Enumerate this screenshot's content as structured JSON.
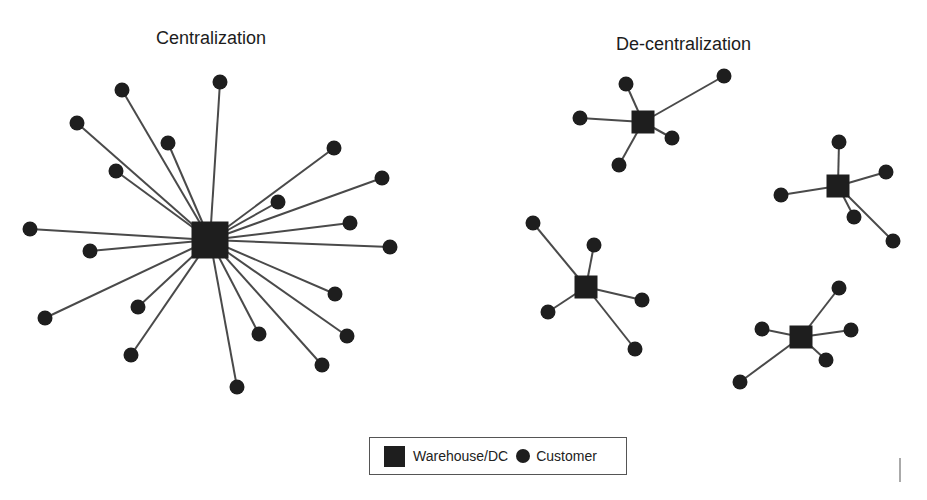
{
  "titles": {
    "centralization": "Centralization",
    "decentralization": "De-centralization"
  },
  "legend": {
    "warehouse_label": "Warehouse/DC",
    "customer_label": "Customer"
  },
  "colors": {
    "node": "#1e1e1e",
    "edge": "#4a4a4a",
    "background": "#ffffff"
  },
  "networks": {
    "centralization": {
      "hubs": [
        {
          "x": 210,
          "y": 240,
          "size": 37,
          "customers": [
            [
              122,
              90
            ],
            [
              220,
              82
            ],
            [
              77,
              123
            ],
            [
              168,
              143
            ],
            [
              116,
              171
            ],
            [
              334,
              148
            ],
            [
              382,
              178
            ],
            [
              278,
              202
            ],
            [
              350,
              223
            ],
            [
              30,
              229
            ],
            [
              390,
              247
            ],
            [
              90,
              251
            ],
            [
              45,
              318
            ],
            [
              138,
              307
            ],
            [
              335,
              294
            ],
            [
              131,
              355
            ],
            [
              259,
              334
            ],
            [
              347,
              336
            ],
            [
              322,
              365
            ],
            [
              237,
              387
            ]
          ]
        }
      ]
    },
    "decentralization": {
      "hubs": [
        {
          "x": 643,
          "y": 122,
          "size": 23,
          "customers": [
            [
              626,
              84
            ],
            [
              580,
              118
            ],
            [
              724,
              76
            ],
            [
              672,
              138
            ],
            [
              619,
              165
            ]
          ]
        },
        {
          "x": 838,
          "y": 186,
          "size": 23,
          "customers": [
            [
              839,
              142
            ],
            [
              886,
              172
            ],
            [
              781,
              195
            ],
            [
              854,
              217
            ],
            [
              893,
              241
            ]
          ]
        },
        {
          "x": 586,
          "y": 287,
          "size": 23,
          "customers": [
            [
              533,
              223
            ],
            [
              594,
              245
            ],
            [
              548,
              312
            ],
            [
              642,
              300
            ],
            [
              635,
              349
            ]
          ]
        },
        {
          "x": 801,
          "y": 337,
          "size": 23,
          "customers": [
            [
              839,
              288
            ],
            [
              762,
              329
            ],
            [
              851,
              330
            ],
            [
              826,
              360
            ],
            [
              740,
              382
            ]
          ]
        }
      ]
    }
  }
}
